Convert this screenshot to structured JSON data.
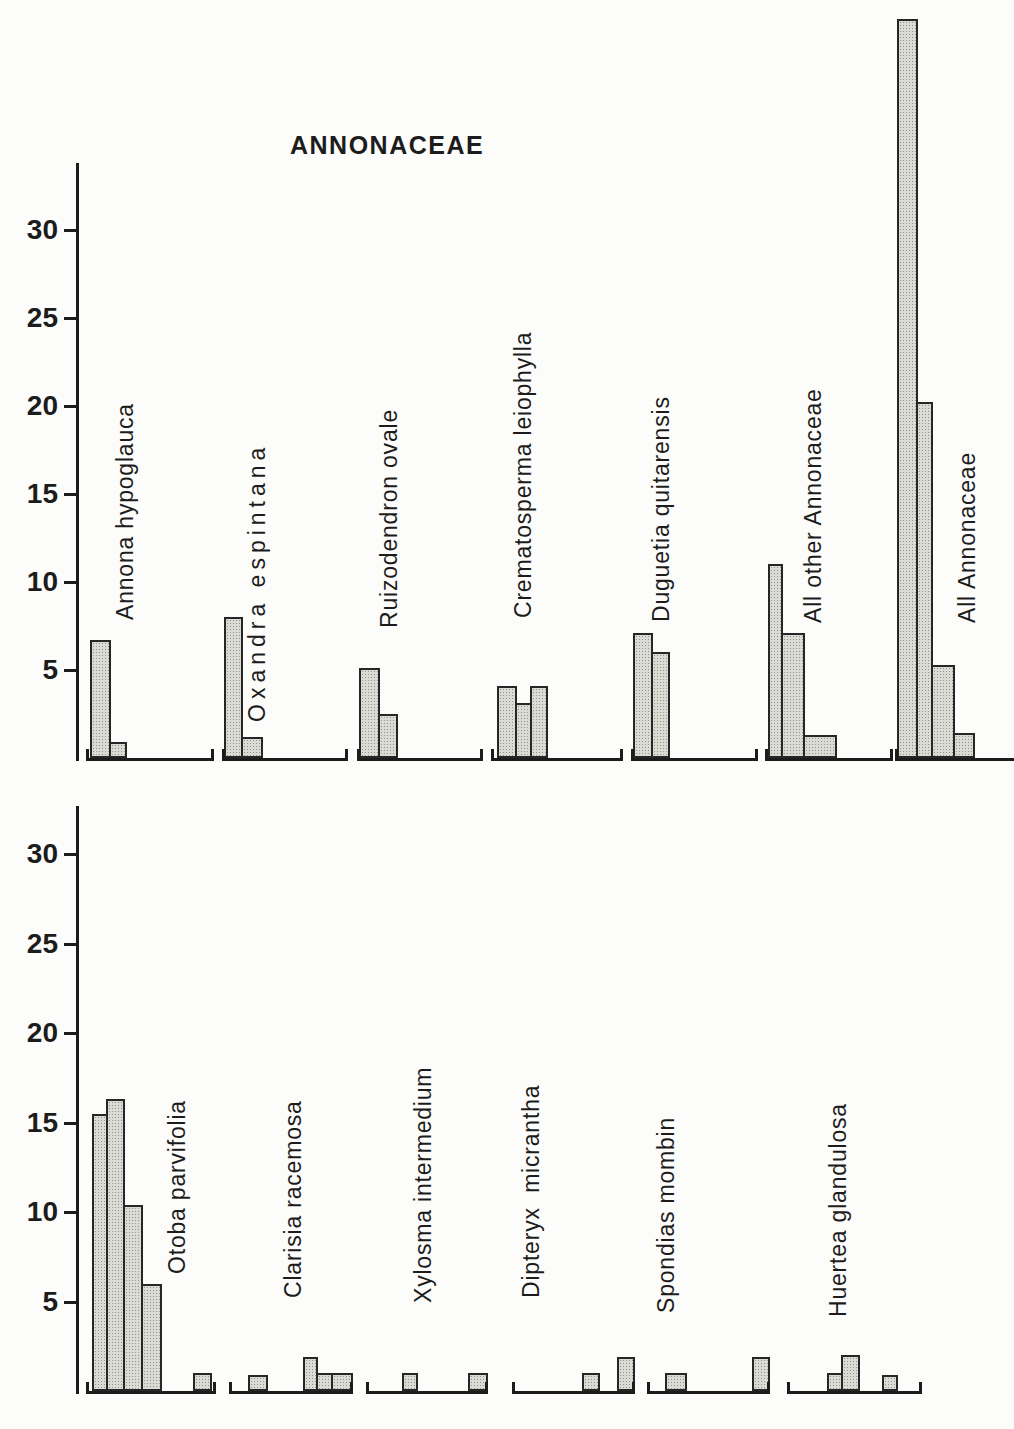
{
  "figure": {
    "title": "ANNONACEAE"
  },
  "chart_data": [
    {
      "type": "bar",
      "title": "ANNONACEAE",
      "xlabel": "",
      "ylabel": "",
      "yticks": [
        5,
        10,
        15,
        20,
        25,
        30
      ],
      "ylim": [
        0,
        34
      ],
      "grid": false,
      "legend": "none",
      "axis": {
        "x": 76,
        "top": 163,
        "baseline_y": 758,
        "px_per_unit": 17.6
      },
      "tick_label_right_edge": 64,
      "histograms": [
        {
          "label": "Annona hypoglauca",
          "values": [
            6.7,
            0.9
          ],
          "baseline": [
            86,
            214
          ],
          "bars": [
            {
              "x": 90,
              "w": 21,
              "v": 6.7
            },
            {
              "x": 111,
              "w": 16,
              "v": 0.9
            }
          ],
          "label_anchor": {
            "x": 125,
            "y": 620
          }
        },
        {
          "label": "Oxandra espintana",
          "values": [
            8.0,
            1.2
          ],
          "baseline": [
            222,
            348
          ],
          "bars": [
            {
              "x": 224,
              "w": 19,
              "v": 8.0
            },
            {
              "x": 243,
              "w": 20,
              "v": 1.2
            }
          ],
          "label_anchor": {
            "x": 257,
            "y": 722
          },
          "letter_spacing": 5
        },
        {
          "label": "Ruizodendron ovale",
          "values": [
            5.1,
            2.5
          ],
          "baseline": [
            357,
            483
          ],
          "bars": [
            {
              "x": 359,
              "w": 21,
              "v": 5.1
            },
            {
              "x": 380,
              "w": 18,
              "v": 2.5
            }
          ],
          "label_anchor": {
            "x": 389,
            "y": 628
          }
        },
        {
          "label": "Crematosperma leiophylla",
          "values": [
            4.1,
            3.1,
            4.1
          ],
          "baseline": [
            491,
            623
          ],
          "bars": [
            {
              "x": 497,
              "w": 20,
              "v": 4.1
            },
            {
              "x": 517,
              "w": 15,
              "v": 3.1
            },
            {
              "x": 532,
              "w": 16,
              "v": 4.1
            }
          ],
          "label_anchor": {
            "x": 523,
            "y": 618
          }
        },
        {
          "label": "Duguetia quitarensis",
          "values": [
            7.1,
            6.0
          ],
          "baseline": [
            631,
            758
          ],
          "bars": [
            {
              "x": 633,
              "w": 20,
              "v": 7.1
            },
            {
              "x": 653,
              "w": 17,
              "v": 6.0
            }
          ],
          "label_anchor": {
            "x": 661,
            "y": 622
          }
        },
        {
          "label": "All other Annonaceae",
          "values": [
            11.0,
            7.1,
            1.3
          ],
          "baseline": [
            765,
            893
          ],
          "bars": [
            {
              "x": 768,
              "w": 15,
              "v": 11.0
            },
            {
              "x": 783,
              "w": 22,
              "v": 7.1
            },
            {
              "x": 805,
              "w": 32,
              "v": 1.3
            }
          ],
          "label_anchor": {
            "x": 813,
            "y": 623
          }
        },
        {
          "label": "All Annonaceae",
          "values": [
            42.0,
            20.2,
            5.3,
            1.4
          ],
          "baseline": [
            895,
            1014
          ],
          "right_tick": false,
          "bars": [
            {
              "x": 897,
              "w": 21,
              "v": 42.0
            },
            {
              "x": 918,
              "w": 15,
              "v": 20.2
            },
            {
              "x": 933,
              "w": 22,
              "v": 5.3
            },
            {
              "x": 955,
              "w": 20,
              "v": 1.4
            }
          ],
          "label_anchor": {
            "x": 967,
            "y": 623
          }
        }
      ]
    },
    {
      "type": "bar",
      "title": "",
      "xlabel": "",
      "ylabel": "",
      "yticks": [
        5,
        10,
        15,
        20,
        25,
        30
      ],
      "ylim": [
        0,
        33
      ],
      "grid": false,
      "legend": "none",
      "axis": {
        "x": 76,
        "top": 806,
        "baseline_y": 1391,
        "px_per_unit": 17.9
      },
      "tick_label_right_edge": 64,
      "histograms": [
        {
          "label": "Otoba parvifolia",
          "values": [
            15.5,
            16.3,
            10.4,
            6.0,
            0,
            0,
            1.0
          ],
          "baseline": [
            86,
            216
          ],
          "bars": [
            {
              "x": 92,
              "w": 16,
              "v": 15.5
            },
            {
              "x": 108,
              "w": 17,
              "v": 16.3
            },
            {
              "x": 125,
              "w": 18,
              "v": 10.4
            },
            {
              "x": 143,
              "w": 19,
              "v": 6.0
            },
            {
              "x": 193,
              "w": 19,
              "v": 1.0
            }
          ],
          "label_anchor": {
            "x": 177,
            "y": 1274
          }
        },
        {
          "label": "Clarisia racemosa",
          "values": [
            0,
            0.9,
            0,
            1.9,
            1.0,
            1.0
          ],
          "baseline": [
            229,
            353
          ],
          "bars": [
            {
              "x": 248,
              "w": 20,
              "v": 0.9
            },
            {
              "x": 303,
              "w": 15,
              "v": 1.9
            },
            {
              "x": 318,
              "w": 15,
              "v": 1.0
            },
            {
              "x": 333,
              "w": 20,
              "v": 1.0
            }
          ],
          "label_anchor": {
            "x": 293,
            "y": 1298
          }
        },
        {
          "label": "Xylosma intermedium",
          "values": [
            0,
            1.0,
            0,
            0,
            1.0
          ],
          "baseline": [
            366,
            488
          ],
          "bars": [
            {
              "x": 402,
              "w": 16,
              "v": 1.0
            },
            {
              "x": 468,
              "w": 20,
              "v": 1.0
            }
          ],
          "label_anchor": {
            "x": 423,
            "y": 1303
          }
        },
        {
          "label": "Dipteryx  micrantha",
          "values": [
            0,
            0,
            0,
            1.0,
            0,
            1.9
          ],
          "baseline": [
            512,
            635
          ],
          "bars": [
            {
              "x": 582,
              "w": 18,
              "v": 1.0
            },
            {
              "x": 617,
              "w": 18,
              "v": 1.9
            }
          ],
          "label_anchor": {
            "x": 531,
            "y": 1298
          }
        },
        {
          "label": "Spondias mombin",
          "values": [
            0,
            1.0,
            0,
            0,
            0,
            1.9
          ],
          "baseline": [
            647,
            770
          ],
          "bars": [
            {
              "x": 665,
              "w": 22,
              "v": 1.0
            },
            {
              "x": 752,
              "w": 18,
              "v": 1.9
            }
          ],
          "label_anchor": {
            "x": 666,
            "y": 1313
          }
        },
        {
          "label": "Huertea glandulosa",
          "values": [
            0,
            0,
            1.0,
            2.0,
            0,
            0.9
          ],
          "baseline": [
            787,
            922
          ],
          "bars": [
            {
              "x": 827,
              "w": 16,
              "v": 1.0
            },
            {
              "x": 843,
              "w": 17,
              "v": 2.0
            },
            {
              "x": 882,
              "w": 16,
              "v": 0.9
            }
          ],
          "label_anchor": {
            "x": 838,
            "y": 1317
          }
        }
      ]
    }
  ]
}
